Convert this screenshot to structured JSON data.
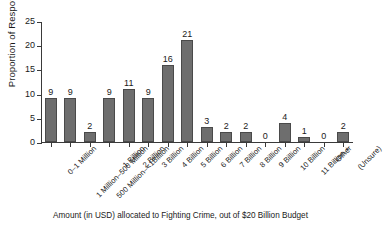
{
  "chart_data": {
    "type": "bar",
    "title": "",
    "xlabel": "Amount (in USD) allocated to Fighting Crime, out of $20 Billion Budget",
    "ylabel": "Proportion of Respondents",
    "ylim": [
      0,
      25
    ],
    "yticks": [
      0,
      5,
      10,
      15,
      20,
      25
    ],
    "grid": false,
    "legend": "none",
    "bar_color": "#6e6e6e",
    "bar_edge_color": "#4a4a4a",
    "categories": [
      "0–1 Million",
      "1 Million–500 Million",
      "500 Million–<1Billion",
      "1 Billion",
      "2 Billion",
      "3 Billion",
      "4 Billion",
      "5 Billion",
      "6 Billion",
      "7 Billion",
      "8 Billion",
      "9 Billion",
      "10 Billion",
      "11 Billion +",
      "Other",
      "(Unsure)"
    ],
    "values": [
      9,
      9,
      2,
      9,
      11,
      9,
      16,
      21,
      3,
      2,
      2,
      0,
      4,
      1,
      0,
      2
    ]
  }
}
